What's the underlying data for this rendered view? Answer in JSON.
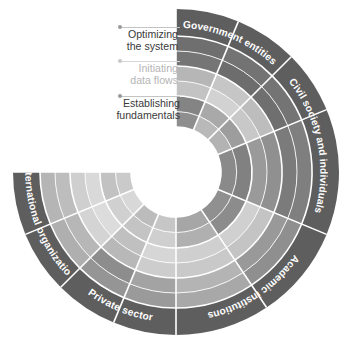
{
  "figure": {
    "type": "radial-segmented-wheel",
    "title": "",
    "background_color": "#ffffff",
    "center": {
      "x": 176,
      "y": 172
    },
    "hole_radius": 45,
    "outer_radius": 163,
    "label_ring_inner_radius": 136,
    "separator_color": "#ffffff",
    "separator_width": 1.6,
    "blank_sector": {
      "start_deg": 180,
      "end_deg": 225,
      "note": "upper-left quadrant left white for legend"
    }
  },
  "legend": {
    "items": [
      {
        "label_line1": "Optimizing",
        "label_line2": "the system",
        "label_full": "Optimizing the system",
        "ring": "outer",
        "text_color": "#3a3a3a",
        "dot_color": "#9a9a9a",
        "leader_color": "#c4c4c4",
        "dot": {
          "x": 120,
          "y": 27
        },
        "leader": {
          "x": 120,
          "y": 27,
          "width": 60
        },
        "text": {
          "right": 178,
          "top": 29
        }
      },
      {
        "label_line1": "Initiating",
        "label_line2": "data flows",
        "label_full": "Initiating data flows",
        "ring": "middle",
        "text_color": "#b5b5b5",
        "dot_color": "#c8c8c8",
        "leader_color": "#d6d6d6",
        "dot": {
          "x": 120,
          "y": 61
        },
        "leader": {
          "x": 120,
          "y": 61,
          "width": 60
        },
        "text": {
          "right": 178,
          "top": 63
        }
      },
      {
        "label_line1": "Establishing",
        "label_line2": "fundamentals",
        "label_full": "Establishing fundamentals",
        "ring": "inner",
        "text_color": "#3a3a3a",
        "dot_color": "#9a9a9a",
        "leader_color": "#c4c4c4",
        "dot": {
          "x": 120,
          "y": 96
        },
        "leader": {
          "x": 120,
          "y": 96,
          "width": 60
        },
        "text": {
          "right": 180,
          "top": 98
        }
      }
    ]
  },
  "chart_data": {
    "type": "heatmap",
    "title": "",
    "subtitle": "",
    "xlabel": "",
    "ylabel": "",
    "legend_position": "top-left",
    "grid": false,
    "stakeholders": [
      {
        "name": "Government entities",
        "start_deg": 270,
        "end_deg": 315,
        "label_ring_color": "#5e5e5e",
        "text_color": "#ffffff",
        "cells": [
          {
            "ring": "inner",
            "band": 0,
            "value": 0.55,
            "color": "#8b8b8b"
          },
          {
            "ring": "inner",
            "band": 1,
            "value": 0.62,
            "color": "#7e7e7e"
          },
          {
            "ring": "middle",
            "band": 0,
            "value": 0.35,
            "color": "#adadad"
          },
          {
            "ring": "middle",
            "band": 1,
            "value": 0.4,
            "color": "#a2a2a2"
          },
          {
            "ring": "outer",
            "band": 0,
            "value": 0.7,
            "color": "#717171"
          },
          {
            "ring": "outer",
            "band": 1,
            "value": 0.72,
            "color": "#6e6e6e"
          }
        ],
        "sub_sectors": [
          {
            "index": 0,
            "start_deg": 270,
            "end_deg": 292.5,
            "rings": [
              {
                "ring": "inner",
                "bands": [
                  "#8e8e8e",
                  "#848484"
                ]
              },
              {
                "ring": "middle",
                "bands": [
                  "#c3c3c3",
                  "#b6b6b6"
                ]
              },
              {
                "ring": "outer",
                "bands": [
                  "#757575",
                  "#6f6f6f"
                ]
              }
            ]
          },
          {
            "index": 1,
            "start_deg": 292.5,
            "end_deg": 315,
            "rings": [
              {
                "ring": "inner",
                "bands": [
                  "#b9b9b9",
                  "#a9a9a9"
                ]
              },
              {
                "ring": "middle",
                "bands": [
                  "#d2d2d2",
                  "#c6c6c6"
                ]
              },
              {
                "ring": "outer",
                "bands": [
                  "#6d6d6d",
                  "#737373"
                ]
              }
            ]
          }
        ]
      },
      {
        "name": "Civil society and individuals",
        "start_deg": 315,
        "end_deg": 22.5,
        "label_ring_color": "#5e5e5e",
        "text_color": "#ffffff",
        "cells": [
          {
            "ring": "inner",
            "band": 0,
            "value": 0.6,
            "color": "#828282"
          },
          {
            "ring": "inner",
            "band": 1,
            "value": 0.58,
            "color": "#868686"
          },
          {
            "ring": "middle",
            "band": 0,
            "value": 0.38,
            "color": "#a8a8a8"
          },
          {
            "ring": "middle",
            "band": 1,
            "value": 0.44,
            "color": "#9c9c9c"
          },
          {
            "ring": "outer",
            "band": 0,
            "value": 0.66,
            "color": "#787878"
          },
          {
            "ring": "outer",
            "band": 1,
            "value": 0.69,
            "color": "#737373"
          }
        ],
        "sub_sectors": [
          {
            "index": 0,
            "start_deg": 315,
            "end_deg": 337.5,
            "rings": [
              {
                "ring": "inner",
                "bands": [
                  "#b3b3b3",
                  "#9d9d9d"
                ]
              },
              {
                "ring": "middle",
                "bands": [
                  "#c8c8c8",
                  "#bdbdbd"
                ]
              },
              {
                "ring": "outer",
                "bands": [
                  "#6f6f6f",
                  "#747474"
                ]
              }
            ]
          },
          {
            "index": 1,
            "start_deg": 337.5,
            "end_deg": 22.5,
            "rings": [
              {
                "ring": "inner",
                "bands": [
                  "#8a8a8a",
                  "#818181"
                ]
              },
              {
                "ring": "middle",
                "bands": [
                  "#9a9a9a",
                  "#909090"
                ]
              },
              {
                "ring": "outer",
                "bands": [
                  "#7b7b7b",
                  "#7f7f7f"
                ]
              }
            ]
          }
        ]
      },
      {
        "name": "Academic institutions",
        "start_deg": 22.5,
        "end_deg": 90,
        "label_ring_color": "#5e5e5e",
        "text_color": "#ffffff",
        "cells": [
          {
            "ring": "inner",
            "band": 0,
            "value": 0.48,
            "color": "#999999"
          },
          {
            "ring": "inner",
            "band": 1,
            "value": 0.3,
            "color": "#b8b8b8"
          },
          {
            "ring": "middle",
            "band": 0,
            "value": 0.25,
            "color": "#c6c6c6"
          },
          {
            "ring": "middle",
            "band": 1,
            "value": 0.28,
            "color": "#bfbfbf"
          },
          {
            "ring": "outer",
            "band": 0,
            "value": 0.52,
            "color": "#949494"
          },
          {
            "ring": "outer",
            "band": 1,
            "value": 0.58,
            "color": "#888888"
          }
        ],
        "sub_sectors": [
          {
            "index": 0,
            "start_deg": 22.5,
            "end_deg": 56.25,
            "rings": [
              {
                "ring": "inner",
                "bands": [
                  "#909090",
                  "#8c8c8c"
                ]
              },
              {
                "ring": "middle",
                "bands": [
                  "#d0d0d0",
                  "#c4c4c4"
                ]
              },
              {
                "ring": "outer",
                "bands": [
                  "#999999",
                  "#8f8f8f"
                ]
              }
            ]
          },
          {
            "index": 1,
            "start_deg": 56.25,
            "end_deg": 90,
            "rings": [
              {
                "ring": "inner",
                "bands": [
                  "#a6a6a6",
                  "#b0b0b0"
                ]
              },
              {
                "ring": "middle",
                "bands": [
                  "#cfcfcf",
                  "#c9c9c9"
                ]
              },
              {
                "ring": "outer",
                "bands": [
                  "#b4b4b4",
                  "#a8a8a8"
                ]
              }
            ]
          }
        ]
      },
      {
        "name": "Private sector",
        "start_deg": 90,
        "end_deg": 135,
        "label_ring_color": "#5e5e5e",
        "text_color": "#ffffff",
        "cells": [
          {
            "ring": "inner",
            "band": 0,
            "value": 0.22,
            "color": "#cbcbcb"
          },
          {
            "ring": "inner",
            "band": 1,
            "value": 0.26,
            "color": "#c2c2c2"
          },
          {
            "ring": "middle",
            "band": 0,
            "value": 0.2,
            "color": "#d0d0d0"
          },
          {
            "ring": "middle",
            "band": 1,
            "value": 0.24,
            "color": "#c7c7c7"
          },
          {
            "ring": "outer",
            "band": 0,
            "value": 0.5,
            "color": "#979797"
          },
          {
            "ring": "outer",
            "band": 1,
            "value": 0.46,
            "color": "#9f9f9f"
          }
        ],
        "sub_sectors": [
          {
            "index": 0,
            "start_deg": 90,
            "end_deg": 112.5,
            "rings": [
              {
                "ring": "inner",
                "bands": [
                  "#c6c6c6",
                  "#cfcfcf"
                ]
              },
              {
                "ring": "middle",
                "bands": [
                  "#d6d6d6",
                  "#cdcdcd"
                ]
              },
              {
                "ring": "outer",
                "bands": [
                  "#a3a3a3",
                  "#9a9a9a"
                ]
              }
            ]
          },
          {
            "index": 1,
            "start_deg": 112.5,
            "end_deg": 135,
            "rings": [
              {
                "ring": "inner",
                "bands": [
                  "#bcbcbc",
                  "#c4c4c4"
                ]
              },
              {
                "ring": "middle",
                "bands": [
                  "#c0c0c0",
                  "#b8b8b8"
                ]
              },
              {
                "ring": "outer",
                "bands": [
                  "#8d8d8d",
                  "#959595"
                ]
              }
            ]
          }
        ]
      },
      {
        "name": "International organizations",
        "start_deg": 135,
        "end_deg": 225,
        "label_ring_color": "#5e5e5e",
        "text_color": "#ffffff",
        "cells": [
          {
            "ring": "inner",
            "band": 0,
            "value": 0.18,
            "color": "#d4d4d4"
          },
          {
            "ring": "inner",
            "band": 1,
            "value": 0.15,
            "color": "#dadada"
          },
          {
            "ring": "middle",
            "band": 0,
            "value": 0.12,
            "color": "#e0e0e0"
          },
          {
            "ring": "middle",
            "band": 1,
            "value": 0.16,
            "color": "#d8d8d8"
          },
          {
            "ring": "outer",
            "band": 0,
            "value": 0.3,
            "color": "#bababa"
          },
          {
            "ring": "outer",
            "band": 1,
            "value": 0.34,
            "color": "#b2b2b2"
          }
        ],
        "sub_sectors": [
          {
            "index": 0,
            "start_deg": 135,
            "end_deg": 157.5,
            "rings": [
              {
                "ring": "inner",
                "bands": [
                  "#d8d8d8",
                  "#d0d0d0"
                ]
              },
              {
                "ring": "middle",
                "bands": [
                  "#dcdcdc",
                  "#d4d4d4"
                ]
              },
              {
                "ring": "outer",
                "bands": [
                  "#b7b7b7",
                  "#afafaf"
                ]
              }
            ]
          },
          {
            "index": 1,
            "start_deg": 157.5,
            "end_deg": 180,
            "rings": [
              {
                "ring": "inner",
                "bands": [
                  "#cacaca",
                  "#c2c2c2"
                ]
              },
              {
                "ring": "middle",
                "bands": [
                  "#d9d9d9",
                  "#cfcfcf"
                ]
              },
              {
                "ring": "outer",
                "bands": [
                  "#bdbdbd",
                  "#b5b5b5"
                ]
              }
            ]
          },
          {
            "index": 2,
            "start_deg": 180,
            "end_deg": 202.5,
            "blank": true,
            "rings": []
          },
          {
            "index": 3,
            "start_deg": 202.5,
            "end_deg": 225,
            "blank": true,
            "rings": []
          }
        ]
      }
    ],
    "rings": [
      {
        "key": "inner",
        "label": "Establishing fundamentals",
        "r_inner": 45,
        "r_outer": 76
      },
      {
        "key": "middle",
        "label": "Initiating data flows",
        "r_inner": 76,
        "r_outer": 106
      },
      {
        "key": "outer",
        "label": "Optimizing the system",
        "r_inner": 106,
        "r_outer": 136
      }
    ]
  }
}
